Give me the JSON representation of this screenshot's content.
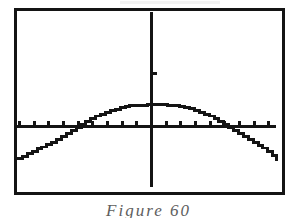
{
  "figure": {
    "caption": "Figure 60",
    "caption_clipped": true
  },
  "screen": {
    "frame_color": "#141414",
    "background_color": "#ffffff",
    "ink_color": "#141414",
    "frame": {
      "x": 14,
      "y": 8,
      "width": 271,
      "height": 187
    }
  },
  "chart_data": {
    "type": "line",
    "title": "",
    "subtitle": "",
    "xlabel": "",
    "ylabel": "",
    "grid": false,
    "legend": null,
    "rendering": "pixelated-stairstep",
    "axes": {
      "x_axis": {
        "pixel_y": 130,
        "from_pixel_x": 17,
        "to_pixel_x": 282,
        "tick_spacing_px": 15,
        "tick_length_px": 5
      },
      "y_axis": {
        "pixel_x": 154,
        "from_pixel_y": 12,
        "to_pixel_y": 193,
        "tick_length_px": 5
      },
      "y_ticks_pixel": [
        75
      ],
      "x_ticks_pixel": [
        19,
        34,
        49,
        64,
        79,
        94,
        109,
        124,
        139,
        154,
        169,
        184,
        199,
        214,
        229,
        244,
        259,
        274
      ],
      "origin_pixel": {
        "x": 154,
        "y": 130
      }
    },
    "xlim": [
      -9.2,
      8.6
    ],
    "ylim": [
      -3.7,
      7.9
    ],
    "x": [
      -9.2,
      -8.6,
      -8.0,
      -7.4,
      -6.8,
      -6.2,
      -5.6,
      -5.0,
      -4.4,
      -3.8,
      -3.2,
      -2.6,
      -2.0,
      -1.4,
      -0.8,
      -0.2,
      0.4,
      1.0,
      1.6,
      2.2,
      2.8,
      3.4,
      4.0,
      4.6,
      5.2,
      5.8,
      6.4,
      7.0,
      7.6,
      8.2,
      8.6
    ],
    "y": [
      -2.15,
      -1.78,
      -1.42,
      -1.07,
      -0.73,
      -0.41,
      -0.11,
      0.17,
      0.43,
      0.66,
      0.87,
      1.05,
      1.2,
      1.31,
      1.4,
      1.45,
      1.45,
      1.42,
      1.35,
      1.25,
      1.11,
      0.95,
      0.75,
      0.52,
      0.27,
      -0.02,
      -0.33,
      -0.67,
      -1.04,
      -1.43,
      -1.7
    ],
    "curve_points_pixel": [
      [
        17,
        163
      ],
      [
        22,
        161
      ],
      [
        27,
        158
      ],
      [
        32,
        156
      ],
      [
        37,
        153
      ],
      [
        42,
        151
      ],
      [
        47,
        148
      ],
      [
        52,
        146
      ],
      [
        57,
        143
      ],
      [
        62,
        140
      ],
      [
        67,
        137
      ],
      [
        72,
        134
      ],
      [
        77,
        131
      ],
      [
        82,
        128
      ],
      [
        87,
        125
      ],
      [
        92,
        122
      ],
      [
        97,
        119
      ],
      [
        102,
        117
      ],
      [
        107,
        115
      ],
      [
        112,
        113
      ],
      [
        117,
        112
      ],
      [
        122,
        110
      ],
      [
        127,
        109
      ],
      [
        132,
        108
      ],
      [
        140,
        108
      ],
      [
        150,
        107
      ],
      [
        160,
        107
      ],
      [
        170,
        108
      ],
      [
        178,
        108
      ],
      [
        183,
        109
      ],
      [
        188,
        110
      ],
      [
        193,
        111
      ],
      [
        198,
        113
      ],
      [
        203,
        115
      ],
      [
        208,
        117
      ],
      [
        213,
        119
      ],
      [
        218,
        122
      ],
      [
        223,
        125
      ],
      [
        228,
        128
      ],
      [
        233,
        131
      ],
      [
        238,
        134
      ],
      [
        243,
        137
      ],
      [
        248,
        140
      ],
      [
        253,
        143
      ],
      [
        258,
        146
      ],
      [
        263,
        149
      ],
      [
        268,
        152
      ],
      [
        273,
        156
      ],
      [
        278,
        160
      ],
      [
        282,
        164
      ]
    ],
    "features": {
      "vertex_pixel": {
        "x": 155,
        "y": 107
      },
      "left_x_intercept_pixel_x": 70,
      "right_x_intercept_pixel_x": 231,
      "left_endpoint_pixel_y": 163,
      "right_endpoint_pixel_y": 164
    }
  }
}
